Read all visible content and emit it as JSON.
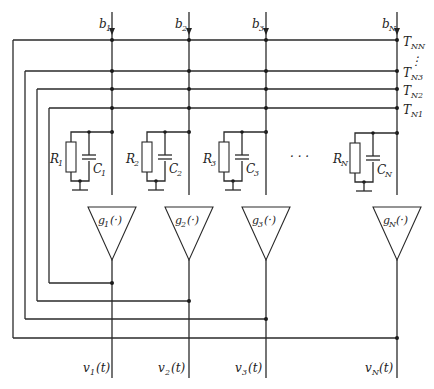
{
  "diagram": {
    "type": "neural-network-circuit",
    "inputs": [
      {
        "base": "b",
        "sub": "1"
      },
      {
        "base": "b",
        "sub": "2"
      },
      {
        "base": "b",
        "sub": "3"
      },
      {
        "base": "b",
        "sub": "N"
      }
    ],
    "connections": [
      {
        "base": "T",
        "sub": "NN"
      },
      {
        "base": "T",
        "sub": "N3"
      },
      {
        "base": "T",
        "sub": "N2"
      },
      {
        "base": "T",
        "sub": "N1"
      }
    ],
    "vdots": "⋮",
    "resistors": [
      {
        "base": "R",
        "sub": "1"
      },
      {
        "base": "R",
        "sub": "2"
      },
      {
        "base": "R",
        "sub": "3"
      },
      {
        "base": "R",
        "sub": "N"
      }
    ],
    "capacitors": [
      {
        "base": "C",
        "sub": "1"
      },
      {
        "base": "C",
        "sub": "2"
      },
      {
        "base": "C",
        "sub": "3"
      },
      {
        "base": "C",
        "sub": "N"
      }
    ],
    "amplifiers": [
      {
        "base": "g",
        "sub": "1",
        "arg": "(·)"
      },
      {
        "base": "g",
        "sub": "2",
        "arg": "(·)"
      },
      {
        "base": "g",
        "sub": "3",
        "arg": "(·)"
      },
      {
        "base": "g",
        "sub": "N",
        "arg": "(·)"
      }
    ],
    "outputs": [
      {
        "base": "v",
        "sub": "1",
        "arg": "(t)"
      },
      {
        "base": "v",
        "sub": "2",
        "arg": "(t)"
      },
      {
        "base": "v",
        "sub": "3",
        "arg": "(t)"
      },
      {
        "base": "v",
        "sub": "N",
        "arg": "(t)"
      }
    ],
    "ellipsis": "· · ·"
  }
}
